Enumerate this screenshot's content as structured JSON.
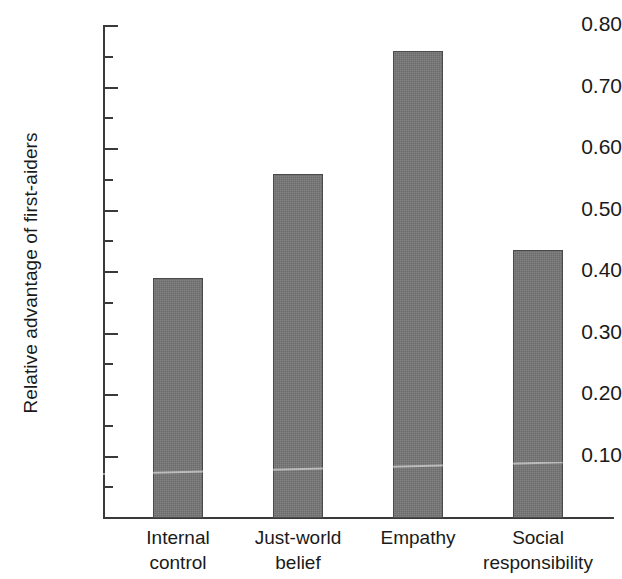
{
  "chart_data": {
    "type": "bar",
    "title": "",
    "xlabel": "",
    "ylabel": "Relative advantage of first-aiders",
    "categories": [
      "Internal control",
      "Just-world belief",
      "Empathy",
      "Social responsibility"
    ],
    "category_lines": [
      [
        "Internal",
        "control"
      ],
      [
        "Just-world",
        "belief"
      ],
      [
        "Empathy",
        ""
      ],
      [
        "Social",
        "responsibility"
      ]
    ],
    "values": [
      0.39,
      0.56,
      0.76,
      0.435
    ],
    "ylim": [
      0.0,
      0.8
    ],
    "ytick_labels": [
      "0.10",
      "0.20",
      "0.30",
      "0.40",
      "0.50",
      "0.60",
      "0.70",
      "0.80"
    ],
    "ytick_values": [
      0.1,
      0.2,
      0.3,
      0.4,
      0.5,
      0.6,
      0.7,
      0.8
    ],
    "yminor_values": [
      0.05,
      0.15,
      0.25,
      0.35,
      0.45,
      0.55,
      0.65,
      0.75
    ],
    "grid": false,
    "legend": null,
    "bar_color": "#767676",
    "bar_edge_color": "#4a4a4a",
    "axis_color": "#3a3a3a"
  }
}
